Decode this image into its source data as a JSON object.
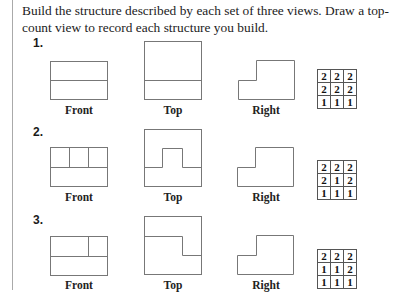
{
  "instructions": "Build the structure described by each set of three views. Draw a top-count view to record each structure you build.",
  "view_labels": {
    "front": "Front",
    "top": "Top",
    "right": "Right"
  },
  "problems": [
    {
      "number": "1.",
      "top_count": [
        [
          "2",
          "2",
          "2"
        ],
        [
          "2",
          "2",
          "2"
        ],
        [
          "1",
          "1",
          "1"
        ]
      ]
    },
    {
      "number": "2.",
      "top_count": [
        [
          "2",
          "2",
          "2"
        ],
        [
          "2",
          "1",
          "2"
        ],
        [
          "1",
          "1",
          "1"
        ]
      ]
    },
    {
      "number": "3.",
      "top_count": [
        [
          "2",
          "2",
          "2"
        ],
        [
          "1",
          "1",
          "2"
        ],
        [
          "1",
          "1",
          "1"
        ]
      ]
    }
  ],
  "colors": {
    "line": "#777777",
    "text": "#222222"
  }
}
